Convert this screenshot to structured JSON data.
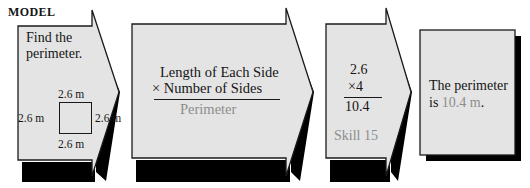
{
  "header": {
    "label": "MODEL"
  },
  "colors": {
    "panel_fill": "#e4e4e4",
    "panel_stroke": "#1a1a1a",
    "shadow": "#000000",
    "text": "#151515",
    "muted_text": "#8d8d8d",
    "page_background": "#ffffff"
  },
  "panels": [
    {
      "name": "step-1-problem",
      "shape": "arrow",
      "prompt_line_1": "Find the",
      "prompt_line_2": "perimeter.",
      "figure": {
        "shape": "square",
        "label_top": "2.6 m",
        "label_right": "2.6 m",
        "label_bottom": "2.6 m",
        "label_left": "2.6 m"
      }
    },
    {
      "name": "step-2-formula",
      "shape": "arrow",
      "numerator_line_1": "Length of Each Side",
      "numerator_line_2": "× Number of Sides",
      "denominator": "Perimeter"
    },
    {
      "name": "step-3-computation",
      "shape": "arrow",
      "operand_1": "2.6",
      "operand_2": "×4",
      "product": "10.4",
      "skill_reference": "Skill 15"
    },
    {
      "name": "step-4-answer",
      "shape": "rectangle",
      "answer_line_1": "The perimeter",
      "answer_line_2_prefix": "is ",
      "answer_line_2_value": "10.4 m",
      "answer_line_2_suffix": "."
    }
  ]
}
